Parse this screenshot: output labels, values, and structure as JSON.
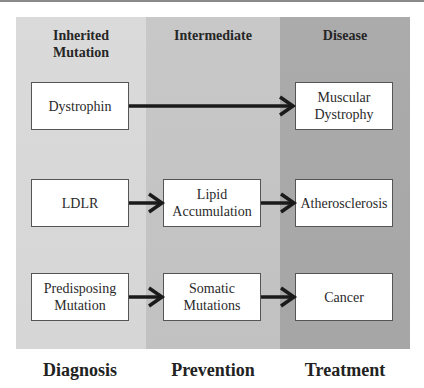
{
  "columns": [
    {
      "header": "Inherited Mutation",
      "header_lines": [
        "Inherited",
        "Mutation"
      ],
      "color": "#d8d8d8"
    },
    {
      "header": "Intermediate",
      "header_lines": [
        "Intermediate"
      ],
      "color": "#c4c4c4"
    },
    {
      "header": "Disease",
      "header_lines": [
        "Disease"
      ],
      "color": "#a8a8a8"
    }
  ],
  "rows": [
    {
      "inherited": {
        "lines": [
          "Dystrophin"
        ]
      },
      "intermediate": null,
      "disease": {
        "lines": [
          "Muscular",
          "Dystrophy"
        ]
      }
    },
    {
      "inherited": {
        "lines": [
          "LDLR"
        ]
      },
      "intermediate": {
        "lines": [
          "Lipid",
          "Accumulation"
        ]
      },
      "disease": {
        "lines": [
          "Atherosclerosis"
        ]
      }
    },
    {
      "inherited": {
        "lines": [
          "Predisposing",
          "Mutation"
        ]
      },
      "intermediate": {
        "lines": [
          "Somatic",
          "Mutations"
        ]
      },
      "disease": {
        "lines": [
          "Cancer"
        ]
      }
    }
  ],
  "footer": [
    "Diagnosis",
    "Prevention",
    "Treatment"
  ],
  "colors": {
    "arrow": "#1a1a1a",
    "box_border": "#555555",
    "box_fill": "#ffffff"
  }
}
